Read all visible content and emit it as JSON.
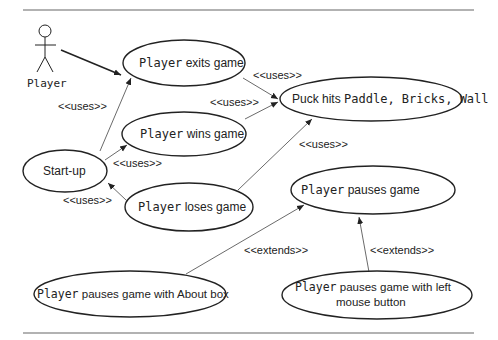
{
  "diagram": {
    "type": "UML use case diagram",
    "actor": {
      "label": "Player"
    },
    "use_cases": [
      {
        "id": "exits",
        "mono_prefix": "Player",
        "rest": " exits game"
      },
      {
        "id": "wins",
        "mono_prefix": "Player",
        "rest": " wins game"
      },
      {
        "id": "loses",
        "mono_prefix": "Player",
        "rest": " loses game"
      },
      {
        "id": "startup",
        "label": "Start-up"
      },
      {
        "id": "puck",
        "prefix": "Puck hits ",
        "mono_rest": "Paddle, Bricks, Wall"
      },
      {
        "id": "pauses",
        "mono_prefix": "Player",
        "rest": " pauses game"
      },
      {
        "id": "pauses_about",
        "mono_prefix": "Player",
        "rest": " pauses game with About box"
      },
      {
        "id": "pauses_mouse",
        "mono_prefix": "Player",
        "rest_line1": " pauses game with left",
        "line2": "mouse button"
      }
    ],
    "relationships": [
      {
        "from": "Player",
        "to": "Player exits game",
        "label": ""
      },
      {
        "from": "Start-up",
        "to": "Player exits game",
        "label": "<<uses>>"
      },
      {
        "from": "Start-up",
        "to": "Player wins game",
        "label": "<<uses>>"
      },
      {
        "from": "Player loses game",
        "to": "Start-up",
        "label": "<<uses>>"
      },
      {
        "from": "Player exits game",
        "to": "Puck hits Paddle, Bricks, Wall",
        "label": "<<uses>>"
      },
      {
        "from": "Player wins game",
        "to": "Puck hits Paddle, Bricks, Wall",
        "label": "<<uses>>"
      },
      {
        "from": "Player loses game",
        "to": "Puck hits Paddle, Bricks, Wall",
        "label": "<<uses>>"
      },
      {
        "from": "Player pauses game with About box",
        "to": "Player pauses game",
        "label": "<<extends>>"
      },
      {
        "from": "Player pauses game with left mouse button",
        "to": "Player pauses game",
        "label": "<<extends>>"
      }
    ],
    "labels": {
      "uses": "<<uses>>",
      "extends": "<<extends>>"
    }
  }
}
